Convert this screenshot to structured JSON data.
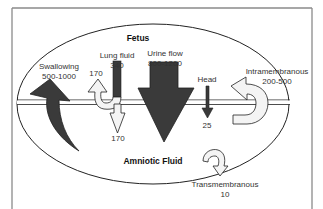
{
  "diagram": {
    "title_top": "Fetus",
    "title_bottom": "Amniotic Fluid",
    "colors": {
      "dark_arrow": "#3a3a3a",
      "light_arrow": "#f4f4f4",
      "outline": "#222222",
      "frame": "#888888"
    },
    "flows": {
      "swallowing": {
        "label": "Swallowing",
        "value": "500-1000",
        "direction": "fluid-to-fetus"
      },
      "lung_fluid": {
        "label": "Lung fluid",
        "value": "340",
        "direction": "fetus-out"
      },
      "lung_fluid_up": {
        "value": "170",
        "direction": "returned-to-fetus"
      },
      "lung_fluid_down": {
        "value": "170",
        "direction": "into-amniotic-fluid"
      },
      "urine_flow": {
        "label": "Urine flow",
        "value": "800-1200",
        "direction": "fetus-to-fluid"
      },
      "head": {
        "label": "Head",
        "value": "25",
        "direction": "fetus-to-fluid"
      },
      "intramembranous": {
        "label": "Intramembranous",
        "value": "200-500",
        "direction": "fluid-to-fetus"
      },
      "transmembranous": {
        "label": "Transmembranous",
        "value": "10",
        "direction": "fluid-out"
      }
    }
  }
}
